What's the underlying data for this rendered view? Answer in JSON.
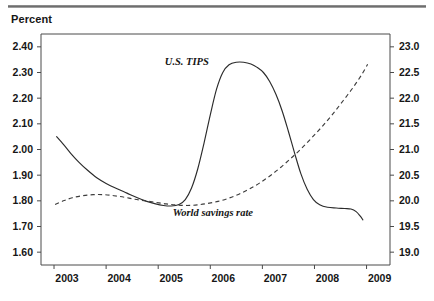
{
  "figure": {
    "unit_label": "Percent"
  },
  "chart_data": {
    "type": "line",
    "title": "",
    "subtitle": "",
    "xlabel": "",
    "ylabel": "Percent",
    "grid": false,
    "legend": "inline-annotations",
    "x": [
      2003,
      2004,
      2005,
      2006,
      2007,
      2008,
      2009
    ],
    "xlim": [
      2002.75,
      2009.45
    ],
    "xtick_labels": [
      "2003",
      "2004",
      "2005",
      "2006",
      "2007",
      "2008",
      "2009"
    ],
    "axes": [
      {
        "id": "left",
        "side": "left",
        "label": "Percent",
        "ylim": [
          1.55,
          2.45
        ],
        "ticks": [
          2.4,
          2.3,
          2.2,
          2.1,
          2.0,
          1.9,
          1.8,
          1.7,
          1.6
        ],
        "tick_labels": [
          "2.40",
          "2.30",
          "2.20",
          "2.10",
          "2.00",
          "1.90",
          "1.80",
          "1.70",
          "1.60"
        ]
      },
      {
        "id": "right",
        "side": "right",
        "label": "",
        "ylim": [
          18.75,
          23.25
        ],
        "ticks": [
          23.0,
          22.5,
          22.0,
          21.5,
          21.0,
          20.5,
          20.0,
          19.5,
          19.0
        ],
        "tick_labels": [
          "23.0",
          "22.5",
          "22.0",
          "21.5",
          "21.0",
          "20.5",
          "20.0",
          "19.5",
          "19.0"
        ]
      }
    ],
    "series": [
      {
        "name": "U.S. TIPS",
        "label": "U.S. TIPS",
        "axis": "left",
        "style": "solid",
        "color": "#2b2b2b",
        "points": [
          [
            2003.05,
            2.05
          ],
          [
            2003.18,
            2.02
          ],
          [
            2003.32,
            1.985
          ],
          [
            2003.48,
            1.95
          ],
          [
            2003.65,
            1.918
          ],
          [
            2003.82,
            1.89
          ],
          [
            2004.0,
            1.868
          ],
          [
            2004.2,
            1.848
          ],
          [
            2004.4,
            1.83
          ],
          [
            2004.6,
            1.812
          ],
          [
            2004.78,
            1.798
          ],
          [
            2004.95,
            1.788
          ],
          [
            2005.1,
            1.782
          ],
          [
            2005.25,
            1.78
          ],
          [
            2005.4,
            1.786
          ],
          [
            2005.52,
            1.805
          ],
          [
            2005.64,
            1.85
          ],
          [
            2005.76,
            1.925
          ],
          [
            2005.88,
            2.025
          ],
          [
            2006.0,
            2.135
          ],
          [
            2006.12,
            2.235
          ],
          [
            2006.24,
            2.3
          ],
          [
            2006.36,
            2.33
          ],
          [
            2006.5,
            2.34
          ],
          [
            2006.64,
            2.34
          ],
          [
            2006.78,
            2.333
          ],
          [
            2006.9,
            2.32
          ],
          [
            2007.02,
            2.3
          ],
          [
            2007.14,
            2.265
          ],
          [
            2007.26,
            2.215
          ],
          [
            2007.38,
            2.15
          ],
          [
            2007.5,
            2.07
          ],
          [
            2007.62,
            1.985
          ],
          [
            2007.74,
            1.905
          ],
          [
            2007.86,
            1.845
          ],
          [
            2007.98,
            1.805
          ],
          [
            2008.1,
            1.785
          ],
          [
            2008.25,
            1.775
          ],
          [
            2008.42,
            1.772
          ],
          [
            2008.58,
            1.77
          ],
          [
            2008.7,
            1.768
          ],
          [
            2008.8,
            1.758
          ],
          [
            2008.88,
            1.74
          ],
          [
            2008.93,
            1.726
          ]
        ]
      },
      {
        "name": "World savings rate",
        "label": "World savings rate",
        "axis": "right",
        "style": "dashed",
        "color": "#3d3d3d",
        "points": [
          [
            2003.02,
            19.93
          ],
          [
            2003.18,
            20.0
          ],
          [
            2003.35,
            20.06
          ],
          [
            2003.55,
            20.1
          ],
          [
            2003.75,
            20.12
          ],
          [
            2003.95,
            20.12
          ],
          [
            2004.15,
            20.1
          ],
          [
            2004.35,
            20.07
          ],
          [
            2004.55,
            20.03
          ],
          [
            2004.75,
            20.0
          ],
          [
            2004.95,
            19.97
          ],
          [
            2005.15,
            19.94
          ],
          [
            2005.35,
            19.92
          ],
          [
            2005.55,
            19.91
          ],
          [
            2005.75,
            19.92
          ],
          [
            2005.95,
            19.95
          ],
          [
            2006.15,
            19.99
          ],
          [
            2006.35,
            20.05
          ],
          [
            2006.55,
            20.13
          ],
          [
            2006.75,
            20.23
          ],
          [
            2006.95,
            20.35
          ],
          [
            2007.15,
            20.49
          ],
          [
            2007.35,
            20.65
          ],
          [
            2007.55,
            20.83
          ],
          [
            2007.75,
            21.02
          ],
          [
            2007.95,
            21.23
          ],
          [
            2008.15,
            21.45
          ],
          [
            2008.35,
            21.69
          ],
          [
            2008.55,
            21.95
          ],
          [
            2008.75,
            22.22
          ],
          [
            2008.92,
            22.48
          ],
          [
            2009.02,
            22.66
          ]
        ]
      }
    ],
    "annotations": [
      {
        "text": "U.S. TIPS",
        "x": 2005.55,
        "y_left": 2.33
      },
      {
        "text": "World savings rate",
        "x": 2006.05,
        "y_left": 1.74
      }
    ]
  }
}
